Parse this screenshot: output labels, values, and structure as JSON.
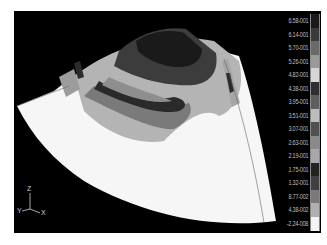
{
  "viewport": {
    "background": "#000000"
  },
  "legend": {
    "entries": [
      {
        "label": "6.58-001",
        "color": "#1a1a1a"
      },
      {
        "label": "6.14-001",
        "color": "#3a3a3a"
      },
      {
        "label": "5.70-001",
        "color": "#6a6a6a"
      },
      {
        "label": "5.26-001",
        "color": "#9a9a9a"
      },
      {
        "label": "4.82-001",
        "color": "#d6d6d6"
      },
      {
        "label": "4.38-001",
        "color": "#2e2e2e"
      },
      {
        "label": "3.95-001",
        "color": "#5e5e5e"
      },
      {
        "label": "3.51-001",
        "color": "#bcbcbc"
      },
      {
        "label": "3.07-001",
        "color": "#505050"
      },
      {
        "label": "2.63-001",
        "color": "#8a8a8a"
      },
      {
        "label": "2.19-001",
        "color": "#a8a8a8"
      },
      {
        "label": "1.75-001",
        "color": "#222222"
      },
      {
        "label": "1.32-001",
        "color": "#404040"
      },
      {
        "label": "8.77-002",
        "color": "#7a7a7a"
      },
      {
        "label": "4.38-002",
        "color": "#b0b0b0"
      },
      {
        "label": "-2.24-008",
        "color": "#f4f4f4"
      }
    ]
  },
  "triad": {
    "z_label": "Z",
    "y_label": "Y",
    "x_label": "X"
  }
}
